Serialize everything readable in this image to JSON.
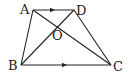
{
  "diagram": {
    "type": "trapezoid-with-diagonals",
    "points": {
      "A": {
        "label": "A",
        "x": 33,
        "y": 10
      },
      "D": {
        "label": "D",
        "x": 74,
        "y": 10
      },
      "B": {
        "label": "B",
        "x": 21,
        "y": 65
      },
      "C": {
        "label": "C",
        "x": 111,
        "y": 65
      },
      "O": {
        "label": "O",
        "x": 57,
        "y": 26
      }
    },
    "segments": [
      "AD",
      "BC",
      "AB",
      "DC",
      "AC",
      "BD"
    ],
    "parallel_marks": [
      "AD",
      "BC"
    ],
    "stroke_color": "#222222"
  }
}
